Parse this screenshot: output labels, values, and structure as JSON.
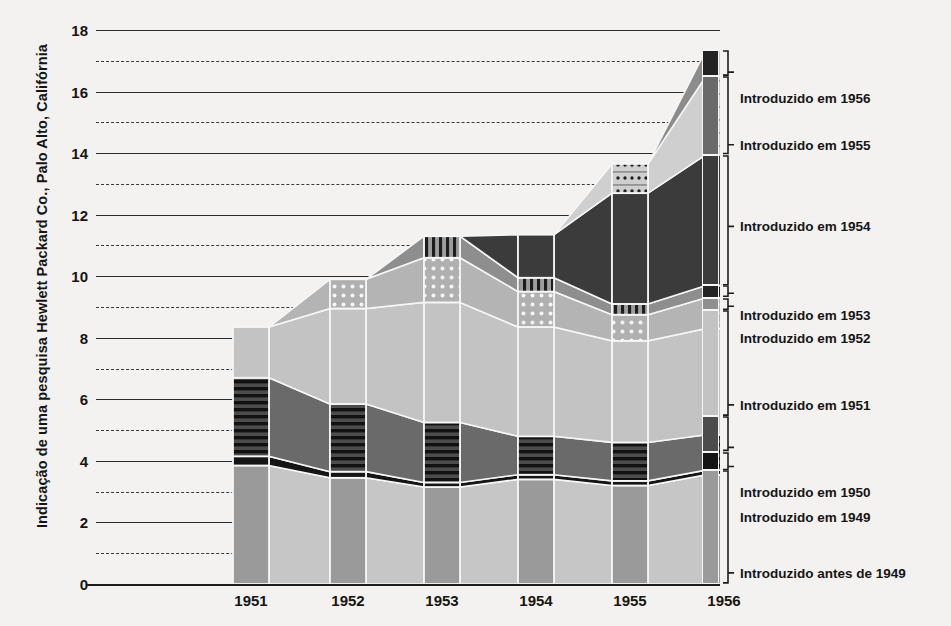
{
  "axis": {
    "y_title": "Indicação de uma pesquisa Hewlett Packard Co., Palo Alto, Califórnia",
    "y_ticks": [
      "0",
      "2",
      "4",
      "6",
      "8",
      "10",
      "12",
      "14",
      "16",
      "18"
    ],
    "x_labels": [
      "1951",
      "1952",
      "1953",
      "1954",
      "1955",
      "1956"
    ]
  },
  "legend": {
    "items": [
      {
        "label": "Introduzido em 1956"
      },
      {
        "label": "Introduzido em 1955"
      },
      {
        "label": "Introduzido em 1954"
      },
      {
        "label": "Introduzido em 1953"
      },
      {
        "label": "Introduzido em 1952"
      },
      {
        "label": "Introduzido em 1951"
      },
      {
        "label": "Introduzido em 1950"
      },
      {
        "label": "Introduzido em 1949"
      },
      {
        "label": "Introduzido antes de 1949"
      }
    ]
  },
  "colors": {
    "background": "#f3f2f0",
    "ink": "#1c1c1c",
    "pre1949": "#9a9a9a",
    "y1949": "#151515",
    "y1950": "#4c4c4c",
    "y1951": "#c3c3c3",
    "y1952": "#b4b4b4",
    "y1953": "#6e6e6e",
    "y1954": "#3b3b3b",
    "y1955": "#cfcfcf",
    "y1956": "#8c8c8c",
    "swatch_1956": "#232323",
    "swatch_1955": "#6a6a6a",
    "swatch_1954": "#3b3b3b",
    "swatch_1953": "#232323",
    "swatch_1952": "#8f8f8f",
    "swatch_1951": "#c3c3c3",
    "swatch_1950": "#4c4c4c",
    "swatch_1949": "#151515",
    "swatch_pre1949": "#9a9a9a"
  },
  "chart_data": {
    "type": "area",
    "title": "",
    "xlabel": "",
    "ylabel": "Indicação de uma pesquisa Hewlett Packard Co., Palo Alto, Califórnia",
    "x": [
      "1951",
      "1952",
      "1953",
      "1954",
      "1955",
      "1956"
    ],
    "ylim": [
      0,
      18
    ],
    "ytick_step": 2,
    "minor_gridlines": true,
    "legend_position": "right",
    "stack_order_bottom_to_top": [
      "pre-1949",
      "1949",
      "1950",
      "1951",
      "1952",
      "1953",
      "1954",
      "1955",
      "1956"
    ],
    "series": [
      {
        "name": "Introduzido antes de 1949",
        "key": "pre1949",
        "values": [
          3.85,
          3.45,
          3.15,
          3.4,
          3.2,
          3.55
        ]
      },
      {
        "name": "Introduzido em 1949",
        "key": "y1949",
        "values": [
          0.3,
          0.2,
          0.15,
          0.15,
          0.15,
          0.15
        ]
      },
      {
        "name": "Introduzido em 1950",
        "key": "y1950",
        "values": [
          2.55,
          2.2,
          1.95,
          1.25,
          1.25,
          1.15
        ]
      },
      {
        "name": "Introduzido em 1951",
        "key": "y1951",
        "values": [
          1.65,
          3.1,
          3.9,
          3.55,
          3.3,
          3.45
        ]
      },
      {
        "name": "Introduzido em 1952",
        "key": "y1952",
        "values": [
          0.0,
          0.95,
          1.45,
          1.15,
          0.85,
          1.0
        ]
      },
      {
        "name": "Introduzido em 1953",
        "key": "y1953",
        "values": [
          0.0,
          0.0,
          0.7,
          0.45,
          0.35,
          0.4
        ]
      },
      {
        "name": "Introduzido em 1954",
        "key": "y1954",
        "values": [
          0.0,
          0.0,
          0.0,
          1.4,
          3.6,
          4.25
        ]
      },
      {
        "name": "Introduzido em 1955",
        "key": "y1955",
        "values": [
          0.0,
          0.0,
          0.0,
          0.0,
          0.95,
          2.55
        ]
      },
      {
        "name": "Introduzido em 1956",
        "key": "y1956",
        "values": [
          0.0,
          0.0,
          0.0,
          0.0,
          0.0,
          0.85
        ]
      }
    ],
    "totals": [
      8.35,
      9.9,
      11.3,
      11.35,
      13.65,
      17.35
    ]
  },
  "layout": {
    "bar_centers_px": [
      155,
      252,
      346,
      440,
      534,
      628
    ],
    "bar_half_width_px": 18,
    "plot_left_px": 0,
    "plot_right_px": 624,
    "legend_tops": [
      17.35,
      16.5,
      13.95,
      9.7,
      9.3,
      8.9,
      5.45,
      4.3,
      3.7,
      0.0
    ]
  }
}
